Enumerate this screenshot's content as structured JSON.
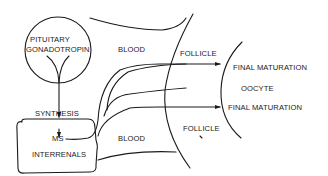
{
  "diagram": {
    "type": "flow",
    "colors": {
      "ink": "#1a1a1a",
      "background": "#ffffff"
    },
    "nodes": {
      "pituitary": {
        "line1": "PITUITARY",
        "line2": "GONADOTROPIN"
      },
      "interrenals": {
        "synthesis": "SYNTHESIS",
        "ms": "MS",
        "name": "INTERRENALS"
      },
      "blood_top": "BLOOD",
      "blood_bottom": "BLOOD",
      "follicle_top": "FOLLICLE",
      "follicle_bottom": "FOLLICLE",
      "oocyte": "OOCYTE",
      "final_maturation_top": "FINAL MATURATION",
      "final_maturation_bottom": "FINAL MATURATION"
    },
    "edges": [
      {
        "from": "PITUITARY GONADOTROPIN",
        "to": "SYNTHESIS"
      },
      {
        "from": "SYNTHESIS",
        "to": "MS"
      },
      {
        "from": "MS",
        "to": "FINAL MATURATION (top)"
      },
      {
        "from": "MS",
        "to": "FINAL MATURATION (bottom)"
      }
    ]
  }
}
